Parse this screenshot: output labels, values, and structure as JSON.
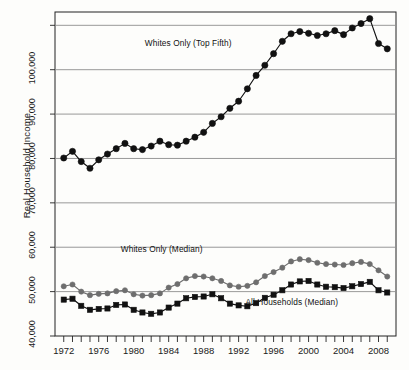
{
  "chart_data": {
    "type": "line",
    "title": "",
    "xlabel": "",
    "ylabel": "Real Household Income",
    "xlim": [
      1971,
      2010
    ],
    "ylim": [
      40000,
      113000
    ],
    "ytick_values": [
      40000,
      50000,
      60000,
      70000,
      80000,
      90000,
      100000
    ],
    "ytick_labels": [
      "40,000",
      "50,000",
      "60,000",
      "70,000",
      "80,000",
      "90,000",
      "100,000"
    ],
    "gridlines_y": [
      40000,
      50000,
      60000,
      70000,
      80000,
      90000,
      100000,
      110000
    ],
    "grid": true,
    "xtick_labels": [
      "1972",
      "1976",
      "1980",
      "1984",
      "1988",
      "1992",
      "1996",
      "2000",
      "2004",
      "2008"
    ],
    "xtick_values": [
      1972,
      1976,
      1980,
      1984,
      1988,
      1992,
      1996,
      2000,
      2004,
      2008
    ],
    "xminor_step": 1,
    "legend_position": "inline-annotations",
    "series": [
      {
        "name": "Whites Only (Top Fifth)",
        "marker": "circle",
        "color": "#111111",
        "label_x": 1987.0,
        "label_y": 106000,
        "x": [
          1972,
          1973,
          1974,
          1975,
          1976,
          1977,
          1978,
          1979,
          1980,
          1981,
          1982,
          1983,
          1984,
          1985,
          1986,
          1987,
          1988,
          1989,
          1990,
          1991,
          1992,
          1993,
          1994,
          1995,
          1996,
          1997,
          1998,
          1999,
          2000,
          2001,
          2002,
          2003,
          2004,
          2005,
          2006,
          2007,
          2008,
          2009
        ],
        "values": [
          80100,
          81600,
          79300,
          77800,
          79700,
          81000,
          82200,
          83400,
          82200,
          82000,
          82800,
          83900,
          83100,
          83000,
          83900,
          84800,
          85900,
          87900,
          89400,
          91300,
          92900,
          95700,
          98700,
          101000,
          103600,
          106400,
          108100,
          108600,
          108200,
          107700,
          108100,
          108800,
          107900,
          109400,
          110400,
          111500,
          105900,
          104700
        ]
      },
      {
        "name": "Whites Only (Median)",
        "marker": "circle",
        "color": "#6e6e6e",
        "label_x": 1983.5,
        "label_y": 59600,
        "x": [
          1972,
          1973,
          1974,
          1975,
          1976,
          1977,
          1978,
          1979,
          1980,
          1981,
          1982,
          1983,
          1984,
          1985,
          1986,
          1987,
          1988,
          1989,
          1990,
          1991,
          1992,
          1993,
          1994,
          1995,
          1996,
          1997,
          1998,
          1999,
          2000,
          2001,
          2002,
          2003,
          2004,
          2005,
          2006,
          2007,
          2008,
          2009
        ],
        "values": [
          51200,
          51600,
          50000,
          49200,
          49500,
          49600,
          50100,
          50300,
          49400,
          49100,
          49200,
          49600,
          50900,
          51700,
          53000,
          53500,
          53400,
          53000,
          52400,
          51400,
          51100,
          51300,
          52100,
          53500,
          54400,
          55400,
          56800,
          57300,
          57100,
          56500,
          56200,
          56100,
          56000,
          56400,
          56700,
          56200,
          54800,
          53400
        ]
      },
      {
        "name": "All Households (Median)",
        "marker": "square",
        "color": "#111111",
        "label_x": 1998.5,
        "label_y": 47600,
        "x": [
          1972,
          1973,
          1974,
          1975,
          1976,
          1977,
          1978,
          1979,
          1980,
          1981,
          1982,
          1983,
          1984,
          1985,
          1986,
          1987,
          1988,
          1989,
          1990,
          1991,
          1992,
          1993,
          1994,
          1995,
          1996,
          1997,
          1998,
          1999,
          2000,
          2001,
          2002,
          2003,
          2004,
          2005,
          2006,
          2007,
          2008,
          2009
        ],
        "values": [
          48200,
          48400,
          46800,
          45900,
          46100,
          46200,
          47000,
          47100,
          45900,
          45300,
          45000,
          45300,
          46400,
          47300,
          48500,
          48800,
          48900,
          49400,
          48500,
          47300,
          46900,
          46700,
          47400,
          48600,
          49300,
          50300,
          51600,
          52300,
          52400,
          51600,
          51100,
          51000,
          50800,
          51200,
          51700,
          52200,
          50300,
          49800
        ]
      }
    ]
  }
}
